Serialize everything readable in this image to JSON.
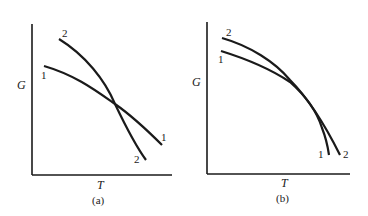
{
  "panels": [
    {
      "id": "a",
      "caption": "(a)",
      "ylabel": "G",
      "xlabel": "T",
      "curves": [
        {
          "label": "1",
          "start_label": "1",
          "end_label": "1"
        },
        {
          "label": "2",
          "start_label": "2",
          "end_label": "2"
        }
      ]
    },
    {
      "id": "b",
      "caption": "(b)",
      "ylabel": "G",
      "xlabel": "T",
      "curves": [
        {
          "label": "1",
          "start_label": "1",
          "end_label": "1"
        },
        {
          "label": "2",
          "start_label": "2",
          "end_label": "2"
        }
      ]
    }
  ],
  "colors": {
    "ink": "#1a1a1a",
    "background": "#ffffff"
  }
}
